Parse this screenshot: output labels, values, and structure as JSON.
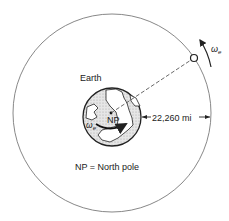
{
  "diagram": {
    "labels": {
      "earth": "Earth",
      "north_pole": "NP",
      "distance": "22,260 mi",
      "omega_satellite": "ω",
      "omega_satellite_sub": "e",
      "omega_earth": "ω",
      "omega_earth_sub": "e",
      "legend": "NP = North pole"
    },
    "colors": {
      "line": "#333333",
      "orbit": "#888888",
      "land_hatch": "#999999"
    }
  }
}
